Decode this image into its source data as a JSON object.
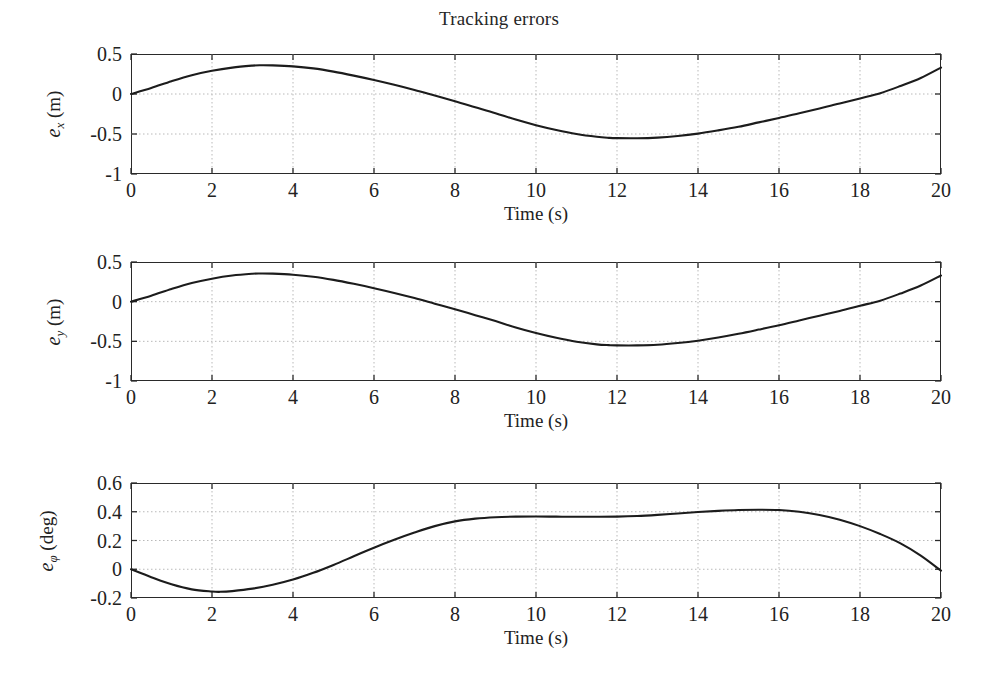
{
  "figure": {
    "title": "Tracking errors",
    "background": "#ffffff",
    "line_color": "#1c1c1c",
    "grid_color": "#b9b9b9",
    "axis_color": "#2a2a2a"
  },
  "axis_labels": {
    "xlabel": "Time (s)",
    "ylabel_1_main": "e",
    "ylabel_1_sub": "x",
    "ylabel_1_unit": " (m)",
    "ylabel_2_main": "e",
    "ylabel_2_sub": "y",
    "ylabel_2_unit": " (m)",
    "ylabel_3_main": "e",
    "ylabel_3_sub": "φ",
    "ylabel_3_unit": " (deg)"
  },
  "ticks": {
    "x_labels": [
      "0",
      "2",
      "4",
      "6",
      "8",
      "10",
      "12",
      "14",
      "16",
      "18",
      "20"
    ],
    "x_values": [
      0,
      2,
      4,
      6,
      8,
      10,
      12,
      14,
      16,
      18,
      20
    ],
    "y_labels_m": [
      "0.5",
      "0",
      "-0.5",
      "-1"
    ],
    "y_values_m": [
      0.5,
      0,
      -0.5,
      -1
    ],
    "y_labels_deg": [
      "0.6",
      "0.4",
      "0.2",
      "0",
      "-0.2"
    ],
    "y_values_deg": [
      0.6,
      0.4,
      0.2,
      0,
      -0.2
    ]
  },
  "chart_data": [
    {
      "type": "line",
      "title": "Tracking errors",
      "xlabel": "Time (s)",
      "ylabel": "e_x (m)",
      "xlim": [
        0,
        20
      ],
      "ylim": [
        -1,
        0.5
      ],
      "grid": true,
      "legend": "none",
      "xticks": [
        0,
        2,
        4,
        6,
        8,
        10,
        12,
        14,
        16,
        18,
        20
      ],
      "yticks": [
        0.5,
        0,
        -0.5,
        -1
      ],
      "x": [
        0,
        0.5,
        1,
        1.5,
        2,
        2.5,
        3,
        3.2,
        3.5,
        4,
        4.5,
        5,
        5.5,
        6,
        6.5,
        7,
        7.5,
        8,
        8.5,
        9,
        9.5,
        10,
        10.5,
        11,
        11.5,
        11.8,
        12,
        12.5,
        13,
        13.5,
        14,
        14.5,
        15,
        15.5,
        16,
        16.5,
        17,
        17.5,
        18,
        18.5,
        19,
        19.5,
        20
      ],
      "y": [
        0.0,
        0.075,
        0.16,
        0.235,
        0.29,
        0.33,
        0.355,
        0.36,
        0.358,
        0.345,
        0.32,
        0.28,
        0.23,
        0.175,
        0.115,
        0.05,
        -0.02,
        -0.09,
        -0.165,
        -0.24,
        -0.32,
        -0.39,
        -0.45,
        -0.5,
        -0.535,
        -0.548,
        -0.552,
        -0.553,
        -0.545,
        -0.525,
        -0.495,
        -0.455,
        -0.41,
        -0.355,
        -0.3,
        -0.24,
        -0.18,
        -0.12,
        -0.055,
        0.01,
        0.1,
        0.2,
        0.33
      ]
    },
    {
      "type": "line",
      "title": "",
      "xlabel": "Time (s)",
      "ylabel": "e_y (m)",
      "xlim": [
        0,
        20
      ],
      "ylim": [
        -1,
        0.5
      ],
      "grid": true,
      "legend": "none",
      "xticks": [
        0,
        2,
        4,
        6,
        8,
        10,
        12,
        14,
        16,
        18,
        20
      ],
      "yticks": [
        0.5,
        0,
        -0.5,
        -1
      ],
      "x": [
        0,
        0.5,
        1,
        1.5,
        2,
        2.5,
        3,
        3.2,
        3.5,
        4,
        4.5,
        5,
        5.5,
        6,
        6.5,
        7,
        7.5,
        8,
        8.5,
        9,
        9.5,
        10,
        10.5,
        11,
        11.5,
        11.8,
        12,
        12.5,
        13,
        13.5,
        14,
        14.5,
        15,
        15.5,
        16,
        16.5,
        17,
        17.5,
        18,
        18.5,
        19,
        19.5,
        20
      ],
      "y": [
        0.0,
        0.075,
        0.16,
        0.235,
        0.29,
        0.33,
        0.352,
        0.355,
        0.353,
        0.34,
        0.315,
        0.275,
        0.225,
        0.17,
        0.11,
        0.045,
        -0.025,
        -0.095,
        -0.17,
        -0.245,
        -0.325,
        -0.395,
        -0.455,
        -0.505,
        -0.538,
        -0.548,
        -0.551,
        -0.551,
        -0.543,
        -0.522,
        -0.492,
        -0.452,
        -0.405,
        -0.352,
        -0.297,
        -0.237,
        -0.177,
        -0.117,
        -0.052,
        0.013,
        0.103,
        0.203,
        0.33
      ]
    },
    {
      "type": "line",
      "title": "",
      "xlabel": "Time (s)",
      "ylabel": "e_phi (deg)",
      "xlim": [
        0,
        20
      ],
      "ylim": [
        -0.2,
        0.6
      ],
      "grid": true,
      "legend": "none",
      "xticks": [
        0,
        2,
        4,
        6,
        8,
        10,
        12,
        14,
        16,
        18,
        20
      ],
      "yticks": [
        0.6,
        0.4,
        0.2,
        0,
        -0.2
      ],
      "x": [
        0,
        0.5,
        1,
        1.5,
        2,
        2.2,
        2.5,
        3,
        3.5,
        4,
        4.5,
        5,
        5.5,
        6,
        6.5,
        7,
        7.5,
        8,
        8.5,
        9,
        9.5,
        10,
        10.5,
        11,
        11.5,
        12,
        12.5,
        13,
        13.5,
        14,
        14.5,
        15,
        15.5,
        16,
        16.5,
        17,
        17.5,
        18,
        18.5,
        19,
        19.5,
        20
      ],
      "y": [
        0.0,
        -0.055,
        -0.105,
        -0.14,
        -0.155,
        -0.157,
        -0.152,
        -0.135,
        -0.108,
        -0.072,
        -0.025,
        0.03,
        0.09,
        0.15,
        0.205,
        0.255,
        0.3,
        0.333,
        0.352,
        0.362,
        0.366,
        0.367,
        0.366,
        0.365,
        0.365,
        0.366,
        0.37,
        0.378,
        0.388,
        0.398,
        0.406,
        0.412,
        0.414,
        0.412,
        0.4,
        0.378,
        0.345,
        0.3,
        0.245,
        0.18,
        0.095,
        -0.01
      ]
    }
  ],
  "geometry": {
    "plot_left": 131,
    "plot_right": 941,
    "subplot_1": {
      "top": 54,
      "bottom": 174,
      "title_y": 18,
      "xlabel_y": 203
    },
    "subplot_2": {
      "top": 262,
      "bottom": 381,
      "xlabel_y": 410
    },
    "subplot_3": {
      "top": 483,
      "bottom": 598,
      "xlabel_y": 627
    }
  }
}
